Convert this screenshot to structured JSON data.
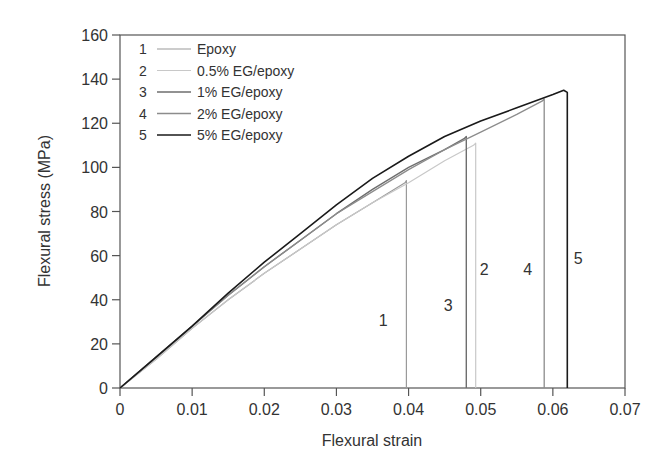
{
  "chart_data": {
    "type": "line",
    "title": "",
    "xlabel": "Flexural strain",
    "ylabel": "Flexural stress (MPa)",
    "xlim": [
      0,
      0.07
    ],
    "ylim": [
      0,
      160
    ],
    "x_ticks": [
      "0",
      "0.01",
      "0.02",
      "0.03",
      "0.04",
      "0.05",
      "0.06",
      "0.07"
    ],
    "y_ticks": [
      "0",
      "20",
      "40",
      "60",
      "80",
      "100",
      "120",
      "140",
      "160"
    ],
    "grid": false,
    "legend_position": "upper-left",
    "series": [
      {
        "id": "1",
        "name": "Epoxy",
        "color": "#9a9a9a",
        "width": 1.2,
        "x": [
          0,
          0.005,
          0.01,
          0.015,
          0.02,
          0.025,
          0.03,
          0.035,
          0.0395,
          0.0397,
          0.0397
        ],
        "y": [
          0,
          13,
          27,
          40,
          52,
          63,
          74,
          84,
          93,
          94,
          0
        ]
      },
      {
        "id": "2",
        "name": "0.5% EG/epoxy",
        "color": "#c8c8c8",
        "width": 1.2,
        "x": [
          0,
          0.005,
          0.01,
          0.015,
          0.02,
          0.025,
          0.03,
          0.035,
          0.04,
          0.045,
          0.049,
          0.0493,
          0.0493
        ],
        "y": [
          0,
          13,
          27,
          40,
          52,
          63,
          74,
          84,
          93,
          103,
          110,
          111,
          0
        ]
      },
      {
        "id": "3",
        "name": "1% EG/epoxy",
        "color": "#6e6e6e",
        "width": 1.4,
        "x": [
          0,
          0.005,
          0.01,
          0.015,
          0.02,
          0.025,
          0.03,
          0.035,
          0.04,
          0.045,
          0.0477,
          0.048,
          0.048
        ],
        "y": [
          0,
          14,
          28,
          42,
          55,
          67,
          79,
          90,
          100,
          108,
          113,
          114,
          0
        ]
      },
      {
        "id": "4",
        "name": "2% EG/epoxy",
        "color": "#8c8c8c",
        "width": 1.3,
        "x": [
          0,
          0.005,
          0.01,
          0.015,
          0.02,
          0.025,
          0.03,
          0.035,
          0.04,
          0.045,
          0.05,
          0.055,
          0.0585,
          0.0588,
          0.0588
        ],
        "y": [
          0,
          14,
          28,
          42,
          55,
          67,
          79,
          89,
          99,
          108,
          116,
          124,
          130,
          131,
          0
        ]
      },
      {
        "id": "5",
        "name": "5% EG/epoxy",
        "color": "#1a1a1a",
        "width": 1.6,
        "x": [
          0,
          0.005,
          0.01,
          0.015,
          0.02,
          0.025,
          0.03,
          0.035,
          0.04,
          0.045,
          0.05,
          0.055,
          0.06,
          0.0615,
          0.062,
          0.062
        ],
        "y": [
          0,
          14,
          28,
          43,
          57,
          70,
          83,
          95,
          105,
          114,
          121,
          127,
          133,
          135,
          134,
          0
        ]
      }
    ],
    "annotations": [
      {
        "text": "1",
        "x": 0.0365,
        "y": 28
      },
      {
        "text": "3",
        "x": 0.0455,
        "y": 35
      },
      {
        "text": "2",
        "x": 0.0505,
        "y": 51
      },
      {
        "text": "4",
        "x": 0.0565,
        "y": 51
      },
      {
        "text": "5",
        "x": 0.0635,
        "y": 56
      }
    ]
  }
}
